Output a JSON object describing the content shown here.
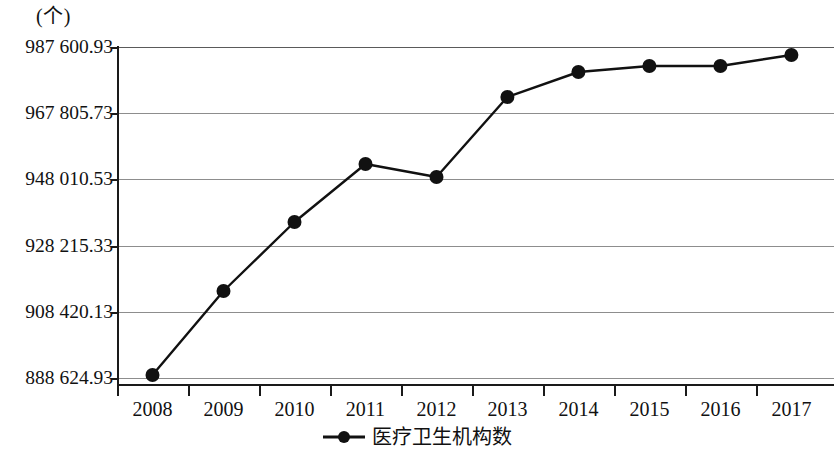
{
  "chart_data": {
    "type": "line",
    "title": "",
    "subtitle": "",
    "unit_label": "(个)",
    "xlabel": "",
    "ylabel": "",
    "categories": [
      "2008",
      "2009",
      "2010",
      "2011",
      "2012",
      "2013",
      "2014",
      "2015",
      "2016",
      "2017"
    ],
    "series": [
      {
        "name": "医疗卫生机构数",
        "values": [
          889522,
          914640,
          935270,
          952610,
          948730,
          972650,
          980120,
          981920,
          981920,
          985210
        ],
        "marker": "circle",
        "color": "#111111"
      }
    ],
    "ylim": [
      888624.93,
      987600.93
    ],
    "ytick_labels": [
      "987 600.93",
      "967 805.73",
      "948 010.53",
      "928 215.33",
      "908 420.13",
      "888 624.93"
    ],
    "ytick_values": [
      987600.93,
      967805.73,
      948010.53,
      928215.33,
      908420.13,
      888624.93
    ],
    "ytick_interval": 19795.2,
    "grid": true,
    "grid_axis": "y",
    "legend": {
      "position": "bottom-center",
      "entries": [
        "医疗卫生机构数"
      ]
    },
    "axis_color": "#1a1a1a",
    "grid_color": "#8d8d8d",
    "background_color": "#ffffff"
  },
  "icons": {
    "legend_marker": "line-with-dot-marker-icon"
  }
}
